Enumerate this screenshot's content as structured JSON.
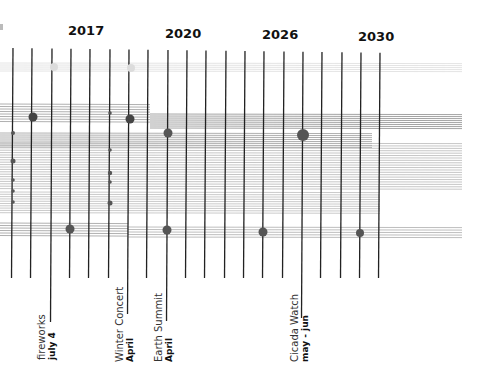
{
  "chart_data": {
    "type": "timeline",
    "title": "",
    "year_labels": [
      {
        "label": "2017",
        "x": 84
      },
      {
        "label": "2020",
        "x": 181
      },
      {
        "label": "2026",
        "x": 278
      },
      {
        "label": "2030",
        "x": 375
      }
    ],
    "gridlines": {
      "x": [
        13,
        32,
        52,
        71,
        90,
        110,
        129,
        148,
        168,
        187,
        206,
        226,
        245,
        264,
        284,
        303,
        322,
        342,
        361,
        380
      ],
      "top": 48,
      "bottom": 278,
      "long": [
        {
          "x": 52,
          "bottom": 322
        },
        {
          "x": 129,
          "bottom": 314
        },
        {
          "x": 168,
          "bottom": 321
        },
        {
          "x": 303,
          "bottom": 318
        }
      ],
      "color": "#222222"
    },
    "bands": [
      {
        "y": 63,
        "count": 5,
        "spacing": 2,
        "x1": 0,
        "x2": 462,
        "color": "#dddddd"
      },
      {
        "y": 104,
        "count": 8,
        "spacing": 2.5,
        "x1": 0,
        "x2": 150,
        "color": "#999999"
      },
      {
        "y": 114,
        "count": 8,
        "spacing": 2,
        "x1": 150,
        "x2": 462,
        "color": "#888888"
      },
      {
        "y": 133,
        "count": 8,
        "spacing": 2,
        "x1": 0,
        "x2": 372,
        "color": "#999999"
      },
      {
        "y": 143,
        "count": 20,
        "spacing": 2.4,
        "x1": 0,
        "x2": 462,
        "color": "#b5b5b5"
      },
      {
        "y": 192,
        "count": 10,
        "spacing": 2.3,
        "x1": 0,
        "x2": 380,
        "color": "#bbbbbb"
      },
      {
        "y": 223,
        "count": 6,
        "spacing": 2.5,
        "x1": 0,
        "x2": 128,
        "color": "#999999"
      },
      {
        "y": 227,
        "count": 5,
        "spacing": 2.5,
        "x1": 128,
        "x2": 462,
        "color": "#aaaaaa"
      }
    ],
    "points": [
      {
        "x": 54,
        "y": 67,
        "r": 4,
        "color": "#dcdcdc"
      },
      {
        "x": 131,
        "y": 68,
        "r": 4,
        "color": "#dcdcdc"
      },
      {
        "x": 33,
        "y": 117,
        "r": 4.5,
        "color": "#444444"
      },
      {
        "x": 130,
        "y": 119,
        "r": 4.5,
        "color": "#444444"
      },
      {
        "x": 168,
        "y": 133,
        "r": 4.5,
        "color": "#555555"
      },
      {
        "x": 303,
        "y": 135,
        "r": 6,
        "color": "#555555"
      },
      {
        "x": 70,
        "y": 229,
        "r": 4.5,
        "color": "#555555"
      },
      {
        "x": 167,
        "y": 230,
        "r": 4.5,
        "color": "#555555"
      },
      {
        "x": 263,
        "y": 232,
        "r": 4.5,
        "color": "#555555"
      },
      {
        "x": 360,
        "y": 233,
        "r": 4,
        "color": "#555555"
      },
      {
        "x": 13,
        "y": 133,
        "r": 2,
        "color": "#555555"
      },
      {
        "x": 13,
        "y": 161,
        "r": 2.5,
        "color": "#555555"
      },
      {
        "x": 13,
        "y": 180,
        "r": 1.8,
        "color": "#555555"
      },
      {
        "x": 13,
        "y": 191,
        "r": 1.8,
        "color": "#555555"
      },
      {
        "x": 13,
        "y": 202,
        "r": 1.8,
        "color": "#555555"
      },
      {
        "x": 110,
        "y": 113,
        "r": 1.8,
        "color": "#555555"
      },
      {
        "x": 110,
        "y": 150,
        "r": 1.8,
        "color": "#555555"
      },
      {
        "x": 110,
        "y": 173,
        "r": 2.2,
        "color": "#555555"
      },
      {
        "x": 110,
        "y": 182,
        "r": 1.8,
        "color": "#555555"
      },
      {
        "x": 110,
        "y": 203,
        "r": 2.5,
        "color": "#555555"
      }
    ],
    "events": [
      {
        "name": "fireworks",
        "date": "july 4",
        "x": 52
      },
      {
        "name": "Winter Concert",
        "date": "April",
        "x": 129
      },
      {
        "name": "Earth Summit",
        "date": "April",
        "x": 168
      },
      {
        "name": "Cicada Watch",
        "date": "may - jun",
        "x": 303
      }
    ]
  },
  "years": [
    "2017",
    "2020",
    "2026",
    "2030"
  ],
  "events": [
    {
      "name": "fireworks",
      "date": "july 4"
    },
    {
      "name": "Winter Concert",
      "date": "April"
    },
    {
      "name": "Earth Summit",
      "date": "April"
    },
    {
      "name": "Cicada Watch",
      "date": "may - jun"
    }
  ]
}
